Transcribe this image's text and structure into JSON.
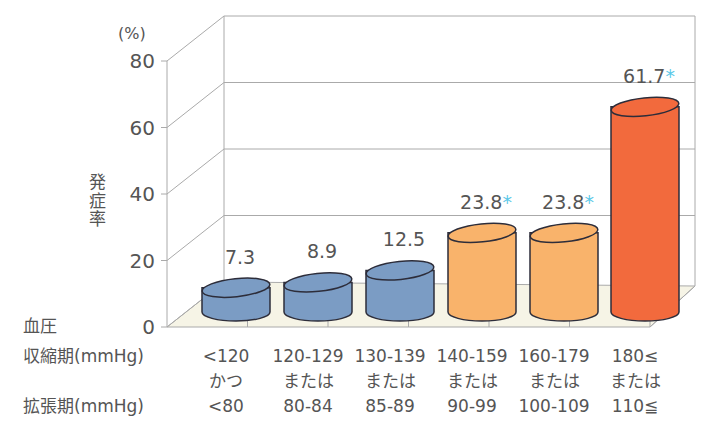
{
  "chart_data": {
    "type": "bar",
    "style": "3d-cylinder",
    "title": "",
    "ylabel": "発症率",
    "y_unit": "(%)",
    "ylim": [
      0,
      80
    ],
    "yticks": [
      0,
      20,
      40,
      60,
      80
    ],
    "grid": true,
    "row_labels": {
      "group": "血圧",
      "systolic": "収縮期(mmHg)",
      "diastolic": "拡張期(mmHg)"
    },
    "categories": [
      {
        "systolic": "<120",
        "connector": "かつ",
        "diastolic": "<80"
      },
      {
        "systolic": "120-129",
        "connector": "または",
        "diastolic": "80-84"
      },
      {
        "systolic": "130-139",
        "connector": "または",
        "diastolic": "85-89"
      },
      {
        "systolic": "140-159",
        "connector": "または",
        "diastolic": "90-99"
      },
      {
        "systolic": "160-179",
        "connector": "または",
        "diastolic": "100-109"
      },
      {
        "systolic": "180≤",
        "connector": "または",
        "diastolic": "110≦"
      }
    ],
    "values": [
      7.3,
      8.9,
      12.5,
      23.8,
      23.8,
      61.7
    ],
    "value_labels": [
      "7.3",
      "8.9",
      "12.5",
      "23.8",
      "23.8",
      "61.7"
    ],
    "significant": [
      false,
      false,
      false,
      true,
      true,
      true
    ],
    "significance_marker": "*",
    "colors": {
      "normal": "#7b9cc4",
      "elevated": "#f9b36b",
      "high": "#f26a3d",
      "outline": "#2d2d3a",
      "star": "#5bc8e8",
      "grid": "#aaaaaa",
      "floor": "#f6f4e6"
    },
    "bar_colors": [
      "#7b9cc4",
      "#7b9cc4",
      "#7b9cc4",
      "#f9b36b",
      "#f9b36b",
      "#f26a3d"
    ]
  }
}
